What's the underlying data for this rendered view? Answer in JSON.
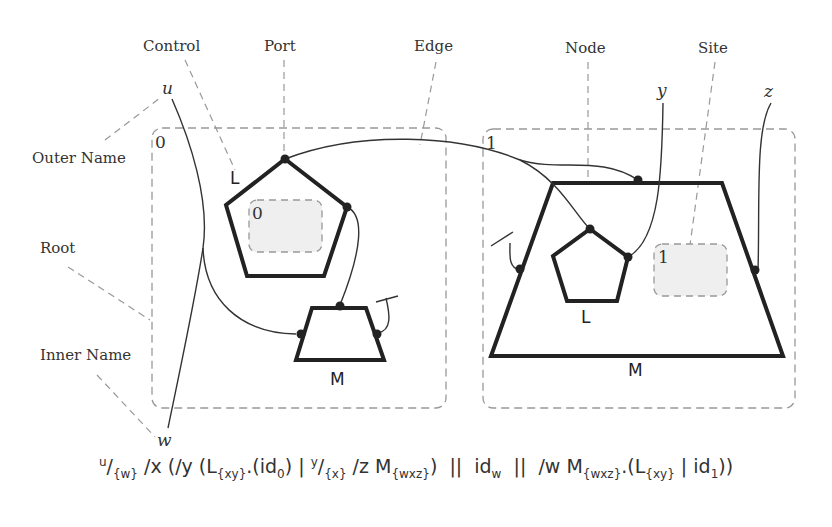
{
  "annotations": {
    "control": "Control",
    "port": "Port",
    "edge": "Edge",
    "node": "Node",
    "site": "Site",
    "outer_name": "Outer Name",
    "root": "Root",
    "inner_name": "Inner Name"
  },
  "names": {
    "u": "u",
    "w": "w",
    "y": "y",
    "z": "z"
  },
  "regions": [
    {
      "index": "0"
    },
    {
      "index": "1"
    }
  ],
  "sites": [
    {
      "index": "0"
    },
    {
      "index": "1"
    }
  ],
  "controls": {
    "left_pentagon": "L",
    "left_trapezoid": "M",
    "right_trapezoid": "M",
    "right_pentagon": "L"
  },
  "formula": {
    "text": "u/{w} /x (/y (L{xy}.(id0) | y/{x} /z M{wxz}) || idw || /w M{wxz}.(L{xy} | id1))",
    "p1_sup": "u",
    "p1_slash": "/",
    "p1_sub": "{w}",
    "p2": " /x (/y (L",
    "p3_sub": "{xy}",
    "p4": ".(id",
    "p5_sub": "0",
    "p6": ") | ",
    "p7_sup": "y",
    "p8_slash": "/",
    "p9_sub": "{x}",
    "p10": " /z M",
    "p11_sub": "{wxz}",
    "p12": ")  ||  id",
    "p13_sub": "w",
    "p14": "  ||  /w M",
    "p15_sub": "{wxz}",
    "p16": ".(L",
    "p17_sub": "{xy}",
    "p18": " | id",
    "p19_sub": "1",
    "p20": "))"
  }
}
